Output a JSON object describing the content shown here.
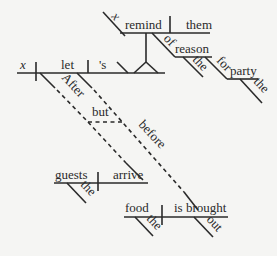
{
  "diagram": {
    "type": "Reed-Kellogg sentence diagram",
    "background": "#f5f5f3",
    "ink": "#2a2a2a",
    "main_clause": {
      "subject": "x",
      "verb": "let",
      "object": "'s",
      "object_complement_compound": true
    },
    "upper_clause": {
      "subject": "x",
      "verb": "remind",
      "object": "them",
      "prep_of": {
        "preposition": "of",
        "object": "reason",
        "modifier": "the"
      },
      "prep_for": {
        "preposition": "for",
        "object": "party",
        "modifier": "the"
      }
    },
    "subordinate": {
      "conjunction_1": "After",
      "connector": "but",
      "conjunction_2": "before",
      "clause_1": {
        "subject": "guests",
        "modifier": "the",
        "verb": "arrive"
      },
      "clause_2": {
        "subject": "food",
        "modifier": "the",
        "verb": "is brought",
        "adverb": "out"
      }
    }
  }
}
